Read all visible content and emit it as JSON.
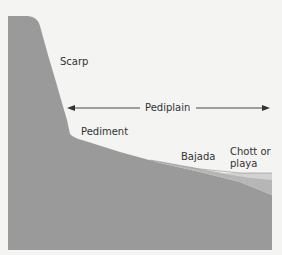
{
  "diagram": {
    "colors": {
      "background": "#f4f4f2",
      "bedrock": "#9a9a9a",
      "bajada": "#b6b6b6",
      "playa": "#d2d2d2",
      "outline": "#7a7a7a",
      "text": "#333333",
      "arrow": "#333333"
    },
    "labels": {
      "scarp": "Scarp",
      "pediplain": "Pediplain",
      "pediment": "Pediment",
      "bajada": "Bajada",
      "chott_line1": "Chott or",
      "chott_line2": "playa"
    },
    "arrow": {
      "type": "double-headed",
      "spans": "Pediplain"
    }
  }
}
